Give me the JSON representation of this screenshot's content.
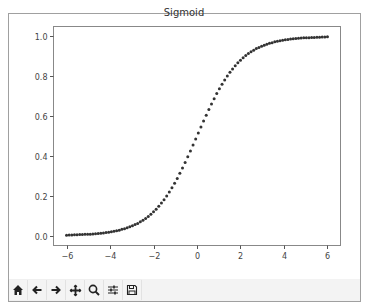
{
  "window": {
    "title": "Sigmoid"
  },
  "toolbar": {
    "buttons": [
      {
        "name": "home",
        "icon": "home-icon",
        "label": "Home"
      },
      {
        "name": "back",
        "icon": "arrow-left-icon",
        "label": "Back"
      },
      {
        "name": "forward",
        "icon": "arrow-right-icon",
        "label": "Forward"
      },
      {
        "name": "pan",
        "icon": "move-icon",
        "label": "Pan"
      },
      {
        "name": "zoom",
        "icon": "magnifier-icon",
        "label": "Zoom"
      },
      {
        "name": "configure",
        "icon": "sliders-icon",
        "label": "Configure subplots"
      },
      {
        "name": "save",
        "icon": "floppy-disk-icon",
        "label": "Save"
      }
    ]
  },
  "chart_data": {
    "type": "scatter",
    "title": "Sigmoid",
    "xlabel": "",
    "ylabel": "",
    "xlim": [
      -6.6,
      6.6
    ],
    "ylim": [
      -0.05,
      1.05
    ],
    "xticks": [
      -6,
      -4,
      -2,
      0,
      2,
      4,
      6
    ],
    "xtick_labels": [
      "−6",
      "−4",
      "−2",
      "0",
      "2",
      "4",
      "6"
    ],
    "yticks": [
      0.0,
      0.2,
      0.4,
      0.6,
      0.8,
      1.0
    ],
    "ytick_labels": [
      "0.0",
      "0.2",
      "0.4",
      "0.6",
      "0.8",
      "1.0"
    ],
    "grid": false,
    "legend": null,
    "marker_color": "#333333",
    "series": [
      {
        "name": "sigmoid",
        "x": [
          -6.0,
          -5.879,
          -5.758,
          -5.636,
          -5.515,
          -5.394,
          -5.273,
          -5.152,
          -5.03,
          -4.909,
          -4.788,
          -4.667,
          -4.545,
          -4.424,
          -4.303,
          -4.182,
          -4.061,
          -3.939,
          -3.818,
          -3.697,
          -3.576,
          -3.455,
          -3.333,
          -3.212,
          -3.091,
          -2.97,
          -2.848,
          -2.727,
          -2.606,
          -2.485,
          -2.364,
          -2.242,
          -2.121,
          -2.0,
          -1.879,
          -1.758,
          -1.636,
          -1.515,
          -1.394,
          -1.273,
          -1.152,
          -1.03,
          -0.909,
          -0.788,
          -0.667,
          -0.545,
          -0.424,
          -0.303,
          -0.182,
          -0.061,
          0.061,
          0.182,
          0.303,
          0.424,
          0.545,
          0.667,
          0.788,
          0.909,
          1.03,
          1.152,
          1.273,
          1.394,
          1.515,
          1.636,
          1.758,
          1.879,
          2.0,
          2.121,
          2.242,
          2.364,
          2.485,
          2.606,
          2.727,
          2.848,
          2.97,
          3.091,
          3.212,
          3.333,
          3.455,
          3.576,
          3.697,
          3.818,
          3.939,
          4.061,
          4.182,
          4.303,
          4.424,
          4.545,
          4.667,
          4.788,
          4.909,
          5.03,
          5.152,
          5.273,
          5.394,
          5.515,
          5.636,
          5.758,
          5.879,
          6.0
        ],
        "y": [
          0.002,
          0.003,
          0.003,
          0.004,
          0.004,
          0.005,
          0.005,
          0.006,
          0.006,
          0.007,
          0.008,
          0.009,
          0.01,
          0.012,
          0.013,
          0.015,
          0.017,
          0.019,
          0.021,
          0.024,
          0.027,
          0.031,
          0.034,
          0.039,
          0.044,
          0.049,
          0.055,
          0.061,
          0.069,
          0.077,
          0.086,
          0.096,
          0.107,
          0.119,
          0.132,
          0.147,
          0.163,
          0.18,
          0.199,
          0.219,
          0.24,
          0.263,
          0.287,
          0.313,
          0.339,
          0.367,
          0.396,
          0.425,
          0.455,
          0.485,
          0.515,
          0.545,
          0.575,
          0.604,
          0.633,
          0.661,
          0.687,
          0.713,
          0.737,
          0.76,
          0.781,
          0.801,
          0.82,
          0.837,
          0.853,
          0.868,
          0.881,
          0.893,
          0.904,
          0.914,
          0.923,
          0.931,
          0.939,
          0.945,
          0.951,
          0.956,
          0.961,
          0.966,
          0.969,
          0.973,
          0.976,
          0.979,
          0.981,
          0.983,
          0.985,
          0.987,
          0.988,
          0.99,
          0.991,
          0.992,
          0.993,
          0.994,
          0.994,
          0.995,
          0.995,
          0.996,
          0.996,
          0.997,
          0.997,
          0.998
        ]
      }
    ]
  }
}
